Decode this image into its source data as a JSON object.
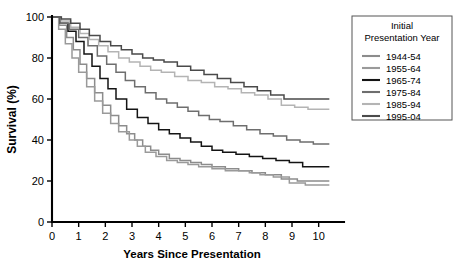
{
  "chart_data": {
    "type": "line",
    "title": "",
    "xlabel": "Years Since Presentation",
    "ylabel": "Survival (%)",
    "xlim": [
      0,
      10.5
    ],
    "ylim": [
      0,
      100
    ],
    "xticks": [
      0,
      1,
      2,
      3,
      4,
      5,
      6,
      7,
      8,
      9,
      10
    ],
    "yticks": [
      0,
      20,
      40,
      60,
      80,
      100
    ],
    "grid": false,
    "legend_position": "top-right",
    "legend_title_line1": "Initial",
    "legend_title_line2": "Presentation Year",
    "series": [
      {
        "name": "1944-54",
        "color": "#8c8c8c",
        "x": [
          0,
          0.28,
          0.55,
          0.8,
          1.05,
          1.3,
          1.6,
          1.9,
          2.2,
          2.5,
          2.8,
          3.1,
          3.4,
          3.7,
          4.0,
          4.4,
          4.8,
          5.2,
          5.6,
          6.0,
          6.5,
          7.0,
          7.5,
          8.0,
          8.6,
          9.2,
          10.4
        ],
        "y": [
          100,
          96,
          90,
          84,
          77,
          70,
          63,
          57,
          52,
          47,
          43,
          40,
          37,
          35,
          33,
          31,
          30,
          29,
          28,
          27,
          26,
          25,
          24,
          23,
          21,
          20,
          20
        ]
      },
      {
        "name": "1955-64",
        "color": "#9a9a9a",
        "x": [
          0,
          0.25,
          0.5,
          0.75,
          1.0,
          1.3,
          1.6,
          1.9,
          2.2,
          2.5,
          2.9,
          3.2,
          3.5,
          3.9,
          4.3,
          4.7,
          5.1,
          5.5,
          6.0,
          6.5,
          7.0,
          7.4,
          7.8,
          8.3,
          8.9,
          9.5,
          10.4
        ],
        "y": [
          100,
          94,
          87,
          80,
          73,
          66,
          59,
          53,
          48,
          44,
          40,
          37,
          34,
          32,
          30,
          29,
          28,
          27,
          26,
          25,
          25,
          24,
          23,
          22,
          19,
          18,
          18
        ]
      },
      {
        "name": "1965-74",
        "color": "#141414",
        "x": [
          0,
          0.3,
          0.6,
          0.9,
          1.2,
          1.5,
          1.8,
          2.1,
          2.4,
          2.8,
          3.2,
          3.6,
          4.0,
          4.4,
          4.8,
          5.2,
          5.6,
          6.0,
          6.4,
          6.9,
          7.4,
          7.9,
          8.4,
          8.9,
          9.4,
          10.4
        ],
        "y": [
          100,
          97,
          93,
          88,
          82,
          76,
          70,
          65,
          60,
          55,
          51,
          48,
          45,
          43,
          41,
          39,
          37,
          35,
          34,
          33,
          32,
          31,
          30,
          29,
          27,
          27
        ]
      },
      {
        "name": "1975-84",
        "color": "#6e6e6e",
        "x": [
          0,
          0.3,
          0.65,
          1.0,
          1.35,
          1.7,
          2.05,
          2.4,
          2.75,
          3.1,
          3.5,
          3.9,
          4.3,
          4.7,
          5.1,
          5.5,
          5.9,
          6.3,
          6.8,
          7.3,
          7.8,
          8.3,
          8.8,
          9.3,
          9.8,
          10.4
        ],
        "y": [
          100,
          97,
          94,
          90,
          86,
          81,
          77,
          73,
          69,
          66,
          63,
          60,
          58,
          56,
          54,
          52,
          50,
          49,
          47,
          45,
          43,
          42,
          40,
          39,
          38,
          38
        ]
      },
      {
        "name": "1985-94",
        "color": "#b4b4b4",
        "x": [
          0,
          0.35,
          0.7,
          1.05,
          1.4,
          1.75,
          2.1,
          2.5,
          2.9,
          3.3,
          3.7,
          4.1,
          4.6,
          5.1,
          5.6,
          6.1,
          6.6,
          7.1,
          7.6,
          8.1,
          8.6,
          9.1,
          9.6,
          10.4
        ],
        "y": [
          100,
          98,
          95,
          92,
          89,
          86,
          83,
          80,
          78,
          76,
          74,
          73,
          71,
          69,
          68,
          66,
          65,
          63,
          62,
          60,
          57,
          56,
          55,
          55
        ]
      },
      {
        "name": "1995-04",
        "color": "#4a4a4a",
        "x": [
          0,
          0.35,
          0.7,
          1.05,
          1.4,
          1.8,
          2.2,
          2.6,
          3.0,
          3.4,
          3.8,
          4.2,
          4.7,
          5.2,
          5.7,
          6.2,
          6.7,
          7.2,
          7.7,
          8.2,
          8.7,
          9.2,
          9.7,
          10.4
        ],
        "y": [
          100,
          99,
          97,
          94,
          91,
          88,
          86,
          84,
          82,
          80,
          79,
          78,
          76,
          74,
          72,
          70,
          68,
          66,
          64,
          62,
          60,
          60,
          60,
          60
        ]
      }
    ]
  }
}
